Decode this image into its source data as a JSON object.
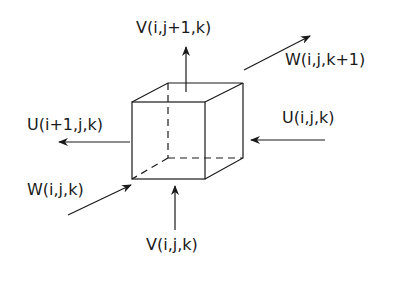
{
  "diagram": {
    "type": "staggered-grid-cell",
    "labels": {
      "v_top": "V(i,j+1,k)",
      "w_front": "W(i,j,k+1)",
      "u_right": "U(i,j,k)",
      "u_left": "U(i+1,j,k)",
      "w_back": "W(i,j,k)",
      "v_bottom": "V(i,j,k)"
    },
    "colors": {
      "line": "#1a1a1a",
      "background": "#ffffff"
    }
  }
}
